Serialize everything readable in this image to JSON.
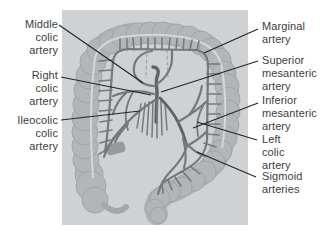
{
  "figure": {
    "type": "anatomical-diagram",
    "labels": {
      "middle_colic": "Middle\ncolic\nartery",
      "right_colic": "Right\ncolic\nartery",
      "ileocolic": "Ileocolic\ncolic\nartery",
      "marginal": "Marginal\nartery",
      "superior_mesenteric": "Superior\nmesanteric\nartery",
      "inferior_mesenteric": "Inferior\nmesanteric\nartery",
      "left_colic": "Left\ncolic\nartery",
      "sigmoid": "Sigmoid\narteries"
    },
    "colors": {
      "page_background": "#ffffff",
      "panel_background": "#cfd1d3",
      "colon_fill": "#b3b5b8",
      "colon_edge": "#a2a4a7",
      "artery": "#76797c",
      "artery_trunk": "#606366",
      "leader_line": "#262626",
      "label_text": "#3d3d3d"
    }
  }
}
